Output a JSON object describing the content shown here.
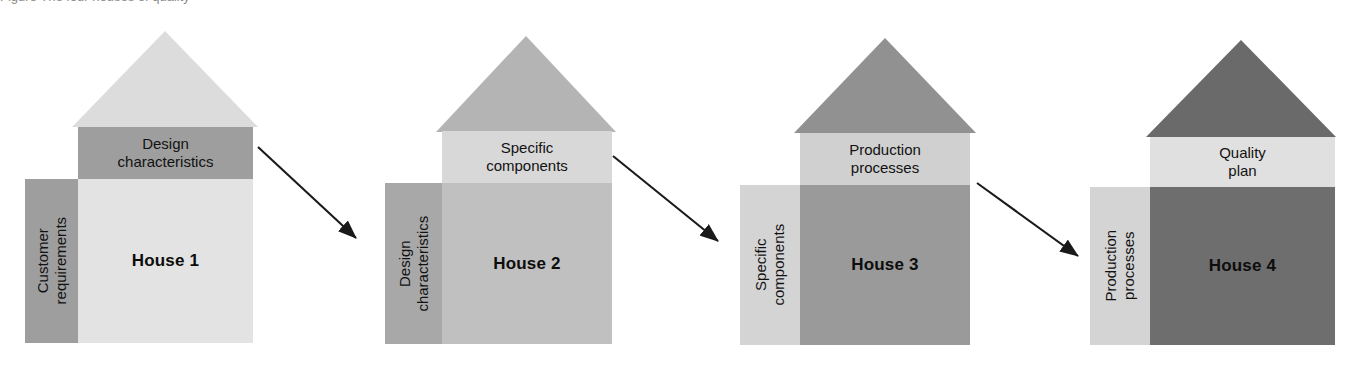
{
  "diagram": {
    "title": "The four houses of quality",
    "cropped_caption_remnant": "Figure  The four houses of quality",
    "background": "#ffffff"
  },
  "houses": [
    {
      "id": "house-1",
      "label": "House 1",
      "band_line1": "Design",
      "band_line2": "characteristics",
      "left_line1": "Customer",
      "left_line2": "requirements",
      "roof_color": "#dcdcdc",
      "band_color": "#9e9e9e",
      "body_color": "#e3e3e3",
      "left_color": "#9e9e9e",
      "geometry": {
        "roof_x": 72,
        "roof_y": 31,
        "roof_w": 186,
        "roof_h": 96,
        "band_x": 78,
        "band_y": 127,
        "band_w": 175,
        "band_h": 52,
        "body_x": 78,
        "body_y": 179,
        "body_w": 175,
        "body_h": 164,
        "left_x": 25,
        "left_y": 179,
        "left_w": 53,
        "left_h": 164
      }
    },
    {
      "id": "house-2",
      "label": "House 2",
      "band_line1": "Specific",
      "band_line2": "components",
      "left_line1": "Design",
      "left_line2": "characteristics",
      "roof_color": "#b4b4b4",
      "band_color": "#d8d8d8",
      "body_color": "#c0c0c0",
      "left_color": "#a8a8a8",
      "geometry": {
        "roof_x": 436,
        "roof_y": 36,
        "roof_w": 180,
        "roof_h": 96,
        "band_x": 442,
        "band_y": 131,
        "band_w": 170,
        "band_h": 52,
        "body_x": 442,
        "body_y": 183,
        "body_w": 170,
        "body_h": 161,
        "left_x": 385,
        "left_y": 183,
        "left_w": 57,
        "left_h": 161
      }
    },
    {
      "id": "house-3",
      "label": "House 3",
      "band_line1": "Production",
      "band_line2": "processes",
      "left_line1": "Specific",
      "left_line2": "components",
      "roof_color": "#919191",
      "band_color": "#d0d0d0",
      "body_color": "#9a9a9a",
      "left_color": "#d4d4d4",
      "geometry": {
        "roof_x": 794,
        "roof_y": 38,
        "roof_w": 182,
        "roof_h": 95,
        "band_x": 800,
        "band_y": 133,
        "band_w": 170,
        "band_h": 52,
        "body_x": 800,
        "body_y": 185,
        "body_w": 170,
        "body_h": 160,
        "left_x": 740,
        "left_y": 185,
        "left_w": 60,
        "left_h": 160
      }
    },
    {
      "id": "house-4",
      "label": "House 4",
      "band_line1": "Quality",
      "band_line2": "plan",
      "left_line1": "Production",
      "left_line2": "processes",
      "roof_color": "#6a6a6a",
      "band_color": "#e0e0e0",
      "body_color": "#6e6e6e",
      "left_color": "#d4d4d4",
      "geometry": {
        "roof_x": 1146,
        "roof_y": 40,
        "roof_w": 190,
        "roof_h": 97,
        "band_x": 1150,
        "band_y": 137,
        "band_w": 185,
        "band_h": 50,
        "body_x": 1150,
        "body_y": 187,
        "body_w": 185,
        "body_h": 158,
        "left_x": 1090,
        "left_y": 187,
        "left_w": 60,
        "left_h": 158
      }
    }
  ],
  "arrows": [
    {
      "id": "arrow-1-to-2",
      "x1": 258,
      "y1": 147,
      "x2": 356,
      "y2": 238
    },
    {
      "id": "arrow-2-to-3",
      "x1": 613,
      "y1": 156,
      "x2": 718,
      "y2": 241
    },
    {
      "id": "arrow-3-to-4",
      "x1": 977,
      "y1": 183,
      "x2": 1078,
      "y2": 256
    }
  ],
  "style": {
    "arrow_color": "#1a1a1a",
    "text_color": "#121212",
    "heading_color": "#0d0d0d"
  }
}
